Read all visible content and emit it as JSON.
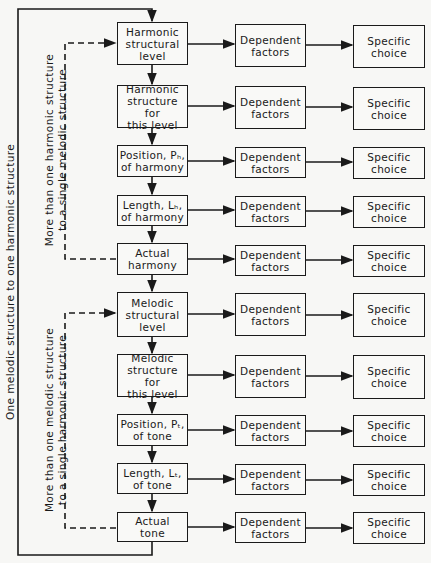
{
  "outer_loop_label": "One melodic structure to one harmonic structure",
  "harmonic_loop_label": "More than one harmonic structure\nto a single melodic structure",
  "melodic_loop_label": "More than one melodic structure\nto a single harmonic structure",
  "steps": [
    {
      "label": "Harmonic\nstructural\nlevel",
      "middle": "Dependent\nfactors",
      "right": "Specific\nchoice"
    },
    {
      "label": "Harmonic\nstructure for\nthis level",
      "middle": "Dependent\nfactors",
      "right": "Specific\nchoice"
    },
    {
      "label": "Position, Pₕ,\nof harmony",
      "middle": "Dependent\nfactors",
      "right": "Specific\nchoice"
    },
    {
      "label": "Length, Lₕ,\nof harmony",
      "middle": "Dependent\nfactors",
      "right": "Specific\nchoice"
    },
    {
      "label": "Actual\nharmony",
      "middle": "Dependent\nfactors",
      "right": "Specific\nchoice"
    },
    {
      "label": "Melodic\nstructural\nlevel",
      "middle": "Dependent\nfactors",
      "right": "Specific\nchoice"
    },
    {
      "label": "Melodic\nstructure for\nthis level",
      "middle": "Dependent\nfactors",
      "right": "Specific\nchoice"
    },
    {
      "label": "Position, Pₜ,\nof tone",
      "middle": "Dependent\nfactors",
      "right": "Specific\nchoice"
    },
    {
      "label": "Length, Lₜ,\nof tone",
      "middle": "Dependent\nfactors",
      "right": "Specific\nchoice"
    },
    {
      "label": "Actual\ntone",
      "middle": "Dependent\nfactors",
      "right": "Specific\nchoice"
    }
  ]
}
